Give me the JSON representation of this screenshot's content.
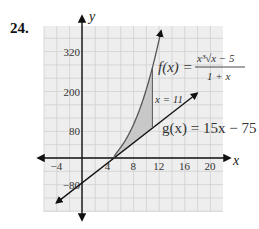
{
  "problem_number": "24.",
  "chart_data": {
    "type": "line",
    "title": "",
    "xlabel": "x",
    "ylabel": "y",
    "xlim": [
      -6,
      22
    ],
    "ylim": [
      -140,
      400
    ],
    "grid": true,
    "grid_step": {
      "x": 2,
      "y": 40
    },
    "x_ticks": [
      -4,
      4,
      8,
      12,
      16,
      20
    ],
    "x_tick_labels": [
      "−4",
      "4",
      "8",
      "12",
      "16",
      "20"
    ],
    "y_ticks": [
      320,
      200,
      80,
      -80
    ],
    "y_tick_labels": [
      "320",
      "200",
      "80",
      "−80"
    ],
    "series": [
      {
        "name": "f(x) = x^3 sqrt(x-5) / (1+x)",
        "kind": "curve",
        "domain": [
          5,
          12.4
        ],
        "x": [
          5,
          6,
          7,
          8,
          9,
          10,
          11,
          12
        ],
        "values": [
          0,
          30.9,
          60.6,
          98.5,
          145.8,
          203.3,
          272.0,
          352.9
        ]
      },
      {
        "name": "g(x) = 15x - 75",
        "kind": "line",
        "domain": [
          -4,
          18
        ],
        "x": [
          -4,
          5,
          11,
          18
        ],
        "values": [
          -135,
          0,
          90,
          195
        ]
      }
    ],
    "shaded_region": {
      "between": [
        "f",
        "g"
      ],
      "x_from": 5,
      "x_to": 11,
      "color": "#c8c8c8"
    },
    "annotations": [
      {
        "text": "x = 11",
        "x": 11,
        "y": 145
      },
      {
        "text": "f(x) = x³√(x−5) / (1+x)",
        "position": "upper-right"
      },
      {
        "text": "g(x) = 15x − 75",
        "position": "right"
      }
    ]
  },
  "labels": {
    "x_axis": "x",
    "y_axis": "y",
    "vertical_line": "x = 11",
    "f_lhs": "f(x) =",
    "f_num": "x³√x − 5",
    "f_den": "1 + x",
    "g_eq": "g(x) = 15x − 75"
  }
}
